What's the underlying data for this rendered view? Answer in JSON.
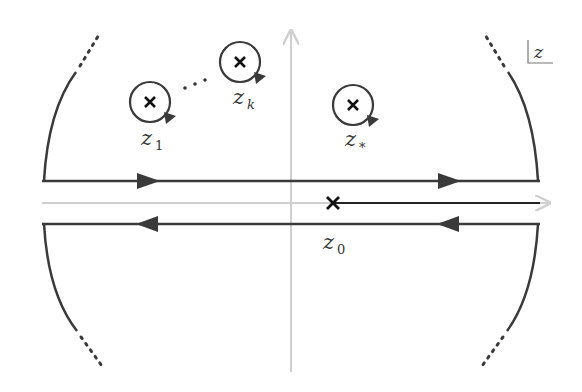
{
  "diagram": {
    "title": "",
    "plane_label": "z",
    "colors": {
      "contour": "#3a3a3a",
      "axis": "#cfcfcf",
      "marker": "#111111"
    },
    "poles": [
      {
        "id": "z1",
        "label": "z",
        "subscript": "1",
        "x": 150,
        "y": 102
      },
      {
        "id": "zk",
        "label": "z",
        "subscript": "k",
        "x": 240,
        "y": 62
      },
      {
        "id": "zstar",
        "label": "z",
        "subscript": "*",
        "x": 353,
        "y": 105
      }
    ],
    "branch_point": {
      "label": "z",
      "subscript": "0",
      "x": 333,
      "y": 202
    },
    "ellipsis": "· · ·"
  }
}
